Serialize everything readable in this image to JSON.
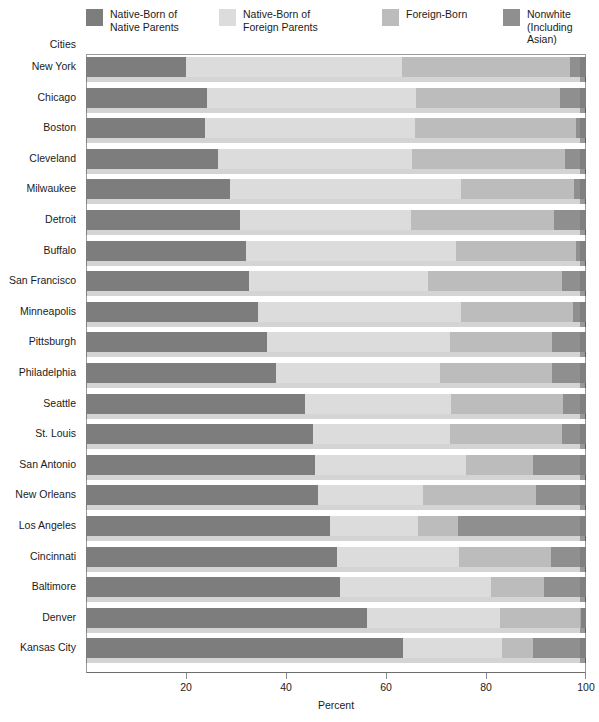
{
  "legend": {
    "items": [
      {
        "label": "Native-Born of\nNative Parents",
        "color": "#7d7d7d",
        "key": "native_native"
      },
      {
        "label": "Native-Born of\nForeign Parents",
        "color": "#dcdcdc",
        "key": "native_foreign"
      },
      {
        "label": "Foreign-Born",
        "color": "#bcbcbc",
        "key": "foreign_born"
      },
      {
        "label": "Nonwhite\n(Including Asian)",
        "color": "#8f8f8f",
        "key": "nonwhite"
      }
    ]
  },
  "axes": {
    "y_title": "Cities",
    "x_title": "Percent",
    "x_ticks": [
      0,
      20,
      40,
      60,
      80,
      100
    ],
    "x_tick_labels": [
      "",
      "20",
      "40",
      "60",
      "80",
      "100"
    ],
    "x_min": 0,
    "x_max": 100
  },
  "chart_data": {
    "type": "bar",
    "orientation": "horizontal",
    "stacked": true,
    "title": "",
    "xlabel": "Percent",
    "ylabel": "Cities",
    "xlim": [
      0,
      100
    ],
    "grid": false,
    "legend_position": "top",
    "categories": [
      "New York",
      "Chicago",
      "Boston",
      "Cleveland",
      "Milwaukee",
      "Detroit",
      "Buffalo",
      "San Francisco",
      "Minneapolis",
      "Pittsburgh",
      "Philadelphia",
      "Seattle",
      "St. Louis",
      "San Antonio",
      "New Orleans",
      "Los Angeles",
      "Cincinnati",
      "Baltimore",
      "Denver",
      "Kansas City"
    ],
    "series": [
      {
        "name": "Native-Born of Native Parents",
        "color": "#7d7d7d",
        "values": [
          20.0,
          24.2,
          23.8,
          26.4,
          28.8,
          30.8,
          32.0,
          32.6,
          34.4,
          36.2,
          38.0,
          43.8,
          45.4,
          45.8,
          46.4,
          48.8,
          50.2,
          50.8,
          56.2,
          63.4
        ]
      },
      {
        "name": "Native-Born of Foreign Parents",
        "color": "#dcdcdc",
        "values": [
          43.2,
          41.8,
          42.0,
          38.8,
          46.2,
          34.2,
          42.0,
          35.8,
          40.6,
          36.6,
          32.8,
          29.2,
          27.4,
          30.2,
          21.0,
          17.6,
          24.4,
          30.2,
          26.6,
          19.8
        ]
      },
      {
        "name": "Foreign-Born",
        "color": "#bcbcbc",
        "values": [
          33.6,
          28.8,
          32.2,
          30.6,
          22.6,
          28.6,
          24.0,
          26.8,
          22.4,
          20.4,
          22.4,
          22.4,
          22.4,
          13.4,
          22.6,
          8.0,
          18.4,
          10.6,
          16.2,
          6.2
        ]
      },
      {
        "name": "Nonwhite (Including Asian)",
        "color": "#8f8f8f",
        "values": [
          3.2,
          5.2,
          2.0,
          4.2,
          2.4,
          6.4,
          2.0,
          4.8,
          2.6,
          6.8,
          6.8,
          4.6,
          4.8,
          10.6,
          10.0,
          25.6,
          7.0,
          8.4,
          1.0,
          10.6
        ]
      }
    ]
  }
}
